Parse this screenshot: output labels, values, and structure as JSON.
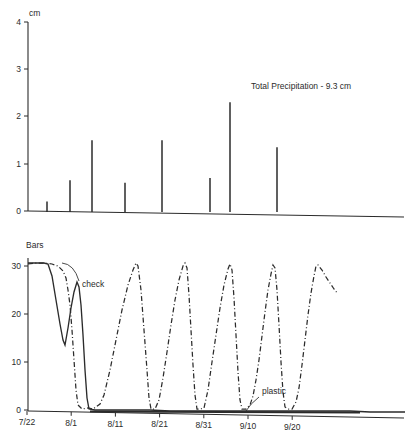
{
  "figure": {
    "background": "#ffffff",
    "ink": "#2b2b2b"
  },
  "chart_data": [
    {
      "type": "bar",
      "id": "precipitation",
      "title": "",
      "xlabel": "",
      "ylabel": "cm",
      "ylim": [
        0,
        4
      ],
      "yticks": [
        0,
        1,
        2,
        3,
        4
      ],
      "ytick_labels": [
        "0",
        "1",
        "2",
        "3",
        "4"
      ],
      "xlim": [
        "7/22",
        "9/20"
      ],
      "xticks": [
        "7/22",
        "8/1",
        "8/11",
        "8/21",
        "8/31",
        "9/10",
        "9/20"
      ],
      "grid": false,
      "legend": false,
      "annotations": [
        {
          "text": "Total Precipitation - 9.3 cm",
          "x_px": 251,
          "y_px": 86
        }
      ],
      "bar_style": "narrow-spike",
      "categories": [
        "7/30",
        "8/3",
        "8/7",
        "8/14",
        "8/21",
        "8/30",
        "9/4",
        "9/14"
      ],
      "values": [
        0.2,
        0.65,
        1.5,
        0.6,
        1.5,
        0.7,
        2.3,
        1.35
      ],
      "x_px": [
        47,
        70,
        92,
        125,
        162,
        210,
        230,
        277
      ]
    },
    {
      "type": "line",
      "id": "soil-moisture-tension",
      "title": "",
      "xlabel": "",
      "ylabel": "Bars",
      "ylim": [
        0,
        33
      ],
      "yticks": [
        0,
        10,
        20,
        30
      ],
      "ytick_labels": [
        "0",
        "10",
        "20",
        "30"
      ],
      "xticks": [
        "7/22",
        "8/1",
        "8/11",
        "8/21",
        "8/31",
        "9/10",
        "9/20"
      ],
      "grid": false,
      "legend": false,
      "annotations": [
        {
          "text": "check",
          "x_px": 86,
          "y_px": 283
        },
        {
          "text": "plastic",
          "x_px": 262,
          "y_px": 394
        }
      ],
      "series": [
        {
          "name": "check",
          "style": "dash-dot",
          "points_px": [
            [
              28,
              264
            ],
            [
              36,
              263
            ],
            [
              44,
              263
            ],
            [
              52,
              264
            ],
            [
              58,
              266
            ],
            [
              63,
              271
            ],
            [
              66,
              278
            ],
            [
              68,
              290
            ],
            [
              70,
              305
            ],
            [
              72,
              330
            ],
            [
              74,
              360
            ],
            [
              76,
              390
            ],
            [
              78,
              405
            ],
            [
              82,
              409
            ],
            [
              88,
              408
            ],
            [
              93,
              409
            ],
            [
              100,
              404
            ],
            [
              104,
              395
            ],
            [
              110,
              370
            ],
            [
              116,
              340
            ],
            [
              122,
              310
            ],
            [
              128,
              285
            ],
            [
              133,
              270
            ],
            [
              136,
              263
            ],
            [
              138,
              266
            ],
            [
              141,
              290
            ],
            [
              144,
              330
            ],
            [
              147,
              370
            ],
            [
              149,
              398
            ],
            [
              151,
              409
            ],
            [
              155,
              409
            ],
            [
              159,
              400
            ],
            [
              163,
              378
            ],
            [
              167,
              352
            ],
            [
              171,
              325
            ],
            [
              175,
              300
            ],
            [
              179,
              280
            ],
            [
              183,
              266
            ],
            [
              185,
              263
            ],
            [
              187,
              268
            ],
            [
              189,
              295
            ],
            [
              191,
              330
            ],
            [
              193,
              365
            ],
            [
              195,
              395
            ],
            [
              197,
              409
            ],
            [
              200,
              409
            ],
            [
              204,
              408
            ],
            [
              208,
              390
            ],
            [
              212,
              362
            ],
            [
              216,
              335
            ],
            [
              220,
              308
            ],
            [
              224,
              285
            ],
            [
              228,
              269
            ],
            [
              230,
              264
            ],
            [
              232,
              270
            ],
            [
              234,
              298
            ],
            [
              236,
              335
            ],
            [
              238,
              372
            ],
            [
              240,
              400
            ],
            [
              242,
              409
            ],
            [
              246,
              409
            ],
            [
              250,
              405
            ],
            [
              253,
              396
            ],
            [
              256,
              380
            ],
            [
              259,
              360
            ],
            [
              262,
              336
            ],
            [
              265,
              312
            ],
            [
              268,
              290
            ],
            [
              271,
              274
            ],
            [
              273,
              265
            ],
            [
              275,
              268
            ],
            [
              277,
              290
            ],
            [
              279,
              325
            ],
            [
              281,
              362
            ],
            [
              283,
              392
            ],
            [
              285,
              407
            ],
            [
              288,
              409
            ],
            [
              292,
              409
            ],
            [
              296,
              402
            ],
            [
              299,
              388
            ],
            [
              302,
              365
            ],
            [
              305,
              340
            ],
            [
              308,
              315
            ],
            [
              311,
              293
            ],
            [
              314,
              276
            ],
            [
              316,
              266
            ],
            [
              318,
              265
            ],
            [
              322,
              270
            ],
            [
              326,
              277
            ],
            [
              330,
              283
            ],
            [
              334,
              289
            ],
            [
              338,
              294
            ]
          ]
        },
        {
          "name": "plastic",
          "style": "solid",
          "points_px": [
            [
              28,
              263
            ],
            [
              36,
              263
            ],
            [
              44,
              263
            ],
            [
              48,
              264
            ],
            [
              52,
              276
            ],
            [
              56,
              300
            ],
            [
              60,
              324
            ],
            [
              63,
              340
            ],
            [
              65,
              345
            ],
            [
              68,
              328
            ],
            [
              71,
              308
            ],
            [
              74,
              292
            ],
            [
              77,
              282
            ],
            [
              79,
              287
            ],
            [
              81,
              305
            ],
            [
              83,
              335
            ],
            [
              85,
              370
            ],
            [
              87,
              398
            ],
            [
              89,
              409
            ],
            [
              95,
              410
            ],
            [
              110,
              410
            ],
            [
              130,
              410
            ],
            [
              150,
              410
            ],
            [
              170,
              411
            ],
            [
              190,
              411
            ],
            [
              210,
              411
            ],
            [
              230,
              411
            ],
            [
              250,
              411
            ],
            [
              270,
              411
            ],
            [
              290,
              411
            ],
            [
              310,
              411
            ],
            [
              330,
              411
            ],
            [
              350,
              411
            ],
            [
              370,
              412
            ],
            [
              390,
              412
            ],
            [
              405,
              412
            ]
          ]
        }
      ]
    }
  ]
}
